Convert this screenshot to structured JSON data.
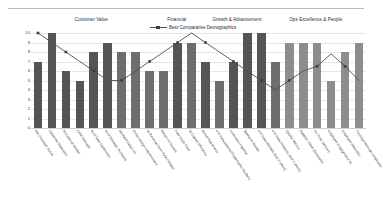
{
  "chart_data": {
    "type": "bar",
    "title": "",
    "xlabel": "",
    "ylabel": "",
    "ylim": [
      0,
      10
    ],
    "yticks": [
      0,
      1,
      2,
      3,
      4,
      5,
      6,
      7,
      8,
      9,
      10
    ],
    "grid": true,
    "legend_position": "top-center",
    "legend": [
      "Best Comparative Demographics"
    ],
    "group_headers": [
      {
        "label": "Customer Value",
        "left_pct": 18.0
      },
      {
        "label": "Financial",
        "left_pct": 43.5
      },
      {
        "label": "Growth & Advancement",
        "left_pct": 61.5
      },
      {
        "label": "Ops Excellence & People",
        "left_pct": 85.0
      }
    ],
    "categories": [
      "Net Promoter Score",
      "Customer Retention",
      "% External Market",
      "CRM Strength",
      "% of New Customers",
      "% of Strategic Accounts",
      "Market/Product Fit",
      "Gross Margin Improvement",
      "% Revenue from New Product",
      "Return on Assets",
      "Free Cash Flow",
      "% Capital Efficiency",
      "Brand Awareness",
      "# of New patents/Trademarks Nanbers",
      "Innovation Pipeline",
      "Speed to Market",
      "# of New Markets (last 3 years)",
      "# of New Products (last 3 years)",
      "Quality Metrics",
      "Supplier Value (Structure)",
      "On Time Delivery",
      "Employee Engagement %",
      "Employee Retention",
      "Training hours per employee"
    ],
    "series": [
      {
        "name": "Score",
        "type": "bar",
        "values": [
          7,
          10,
          6,
          5,
          8,
          9,
          8,
          8,
          6,
          6,
          9,
          9,
          7,
          5,
          7,
          10,
          10,
          7,
          9,
          9,
          9,
          5,
          8,
          9
        ],
        "colors": [
          "#555555",
          "#555555",
          "#555555",
          "#555555",
          "#555555",
          "#555555",
          "#6e6e6e",
          "#6e6e6e",
          "#6e6e6e",
          "#6e6e6e",
          "#555555",
          "#6e6e6e",
          "#555555",
          "#6e6e6e",
          "#555555",
          "#555555",
          "#555555",
          "#6e6e6e",
          "#8d8d8d",
          "#8d8d8d",
          "#8d8d8d",
          "#8d8d8d",
          "#8d8d8d",
          "#8d8d8d"
        ]
      },
      {
        "name": "Best Comparative Demographics",
        "type": "line",
        "color": "#4f4f4f",
        "values": [
          10,
          9,
          8,
          7,
          6,
          5,
          5,
          6,
          7,
          8,
          9,
          10,
          9,
          8,
          7,
          6,
          5,
          4,
          5,
          6,
          6.5,
          7.8,
          6.5,
          5
        ]
      }
    ]
  }
}
